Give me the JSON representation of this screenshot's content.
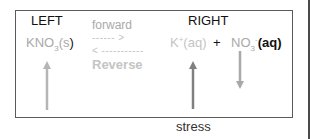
{
  "diagram": {
    "left_label": "LEFT",
    "right_label": "RIGHT",
    "reactant": {
      "base": "KNO",
      "sub": "3",
      "state_open": "(s",
      "state_close": ")"
    },
    "forward_label": "forward",
    "forward_arrow": "------ >",
    "reverse_arrow": "< -----------",
    "reverse_label": "Reverse",
    "product1": {
      "base": "K",
      "sup": "+",
      "state": "(aq)"
    },
    "plus": "+",
    "product2": {
      "base": "NO",
      "sub": "3",
      "sup": "-",
      "state": "(aq)"
    },
    "stress_label": "stress",
    "arrows": [
      {
        "name": "reactant-increase",
        "direction": "up",
        "color": "#b5b5b5"
      },
      {
        "name": "stress-increase",
        "direction": "up",
        "color": "#808080"
      },
      {
        "name": "nitrate-decrease",
        "direction": "down",
        "color": "#a8a8a8"
      }
    ]
  }
}
